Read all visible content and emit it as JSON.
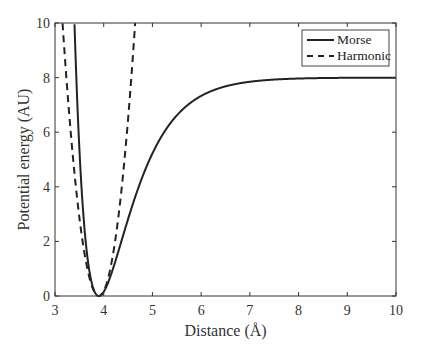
{
  "chart_data": {
    "type": "line",
    "title": "",
    "xlabel": "Distance (Å)",
    "ylabel": "Potential energy (AU)",
    "xlim": [
      3,
      10
    ],
    "ylim": [
      0,
      10
    ],
    "xticks": [
      3,
      4,
      5,
      6,
      7,
      8,
      9,
      10
    ],
    "yticks": [
      0,
      2,
      4,
      6,
      8,
      10
    ],
    "grid": false,
    "legend_position": "upper right",
    "series": [
      {
        "name": "Morse",
        "style": "solid",
        "color": "#222222",
        "x": [
          3.4,
          3.5,
          3.6,
          3.7,
          3.8,
          3.9,
          4.0,
          4.2,
          4.5,
          5.0,
          5.5,
          6.0,
          6.5,
          7.0,
          7.5,
          8.0,
          9.0,
          10.0
        ],
        "y": [
          10.0,
          6.8,
          4.2,
          2.2,
          0.8,
          0.0,
          0.15,
          1.1,
          2.9,
          5.2,
          6.6,
          7.3,
          7.65,
          7.83,
          7.92,
          7.96,
          7.99,
          8.0
        ]
      },
      {
        "name": "Harmonic",
        "style": "dashed",
        "color": "#222222",
        "x": [
          3.15,
          3.3,
          3.5,
          3.7,
          3.9,
          4.1,
          4.3,
          4.5,
          4.6
        ],
        "y": [
          10.0,
          6.5,
          2.9,
          0.72,
          0.0,
          0.72,
          2.9,
          6.5,
          10.0
        ]
      }
    ],
    "morse_params": {
      "D": 8,
      "r0": 3.9,
      "a": 1.5
    },
    "harmonic_params": {
      "k_half": 18,
      "r0": 3.9
    }
  },
  "legend": {
    "items": [
      {
        "label": "Morse",
        "style": "solid"
      },
      {
        "label": "Harmonic",
        "style": "dashed"
      }
    ]
  }
}
